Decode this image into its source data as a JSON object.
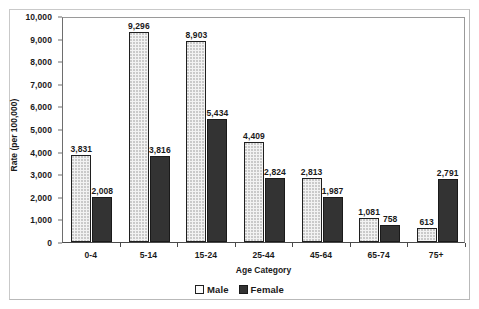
{
  "chart_data": {
    "type": "bar",
    "title": "",
    "xlabel": "Age Category",
    "ylabel": "Rate (per 100,000)",
    "categories": [
      "0-4",
      "5-14",
      "15-24",
      "25-44",
      "45-64",
      "65-74",
      "75+"
    ],
    "series": [
      {
        "name": "Male",
        "values": [
          3831,
          9296,
          8903,
          4409,
          2813,
          1081,
          613
        ],
        "labels": [
          "3,831",
          "9,296",
          "8,903",
          "4,409",
          "2,813",
          "1,081",
          "613"
        ],
        "swatch": "male",
        "color": "#f2f2f2"
      },
      {
        "name": "Female",
        "values": [
          2008,
          3816,
          5434,
          2824,
          1987,
          758,
          2791
        ],
        "labels": [
          "2,008",
          "3,816",
          "5,434",
          "2,824",
          "1,987",
          "758",
          "2,791"
        ],
        "swatch": "female",
        "color": "#333333"
      }
    ],
    "ylim": [
      0,
      10000
    ],
    "y_ticks": [
      0,
      1000,
      2000,
      3000,
      4000,
      5000,
      6000,
      7000,
      8000,
      9000,
      10000
    ],
    "y_tick_labels": [
      "0",
      "1,000",
      "2,000",
      "3,000",
      "4,000",
      "5,000",
      "6,000",
      "7,000",
      "8,000",
      "9,000",
      "10,000"
    ],
    "grid": false,
    "legend_position": "bottom",
    "legend_entries": [
      "Male",
      "Female"
    ]
  }
}
